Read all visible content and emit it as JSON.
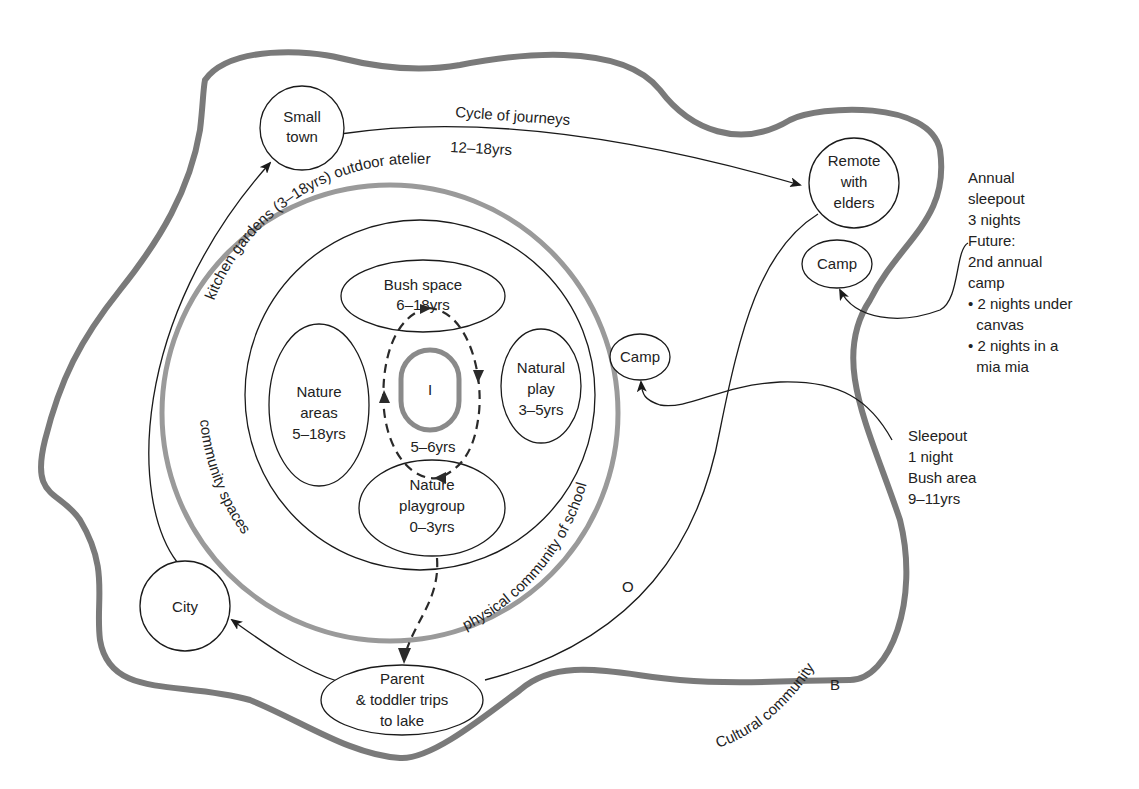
{
  "diagram": {
    "colors": {
      "outer_boundary": "#7a7a7a",
      "school_boundary": "#9a9a9a",
      "inner_self": "#8a8a8a",
      "line": "#1a1a1a"
    },
    "cycle_label": "Cycle of journeys",
    "cycle_age": "12–18yrs",
    "kitchen_label": "kitchen gardens (3–18yrs) outdoor atelier",
    "community_spaces": "community spaces",
    "physical_community": "physical community of school",
    "cultural_community": "Cultural community",
    "letter_o": "O",
    "letter_b": "B",
    "self_label": "I",
    "self_age": "5–6yrs",
    "nodes": {
      "small_town": [
        "Small",
        "town"
      ],
      "remote": [
        "Remote",
        "with",
        "elders"
      ],
      "camp_outer": "Camp",
      "camp_inner": "Camp",
      "city": "City",
      "parent": [
        "Parent",
        "& toddler trips",
        "to lake"
      ],
      "bush_space": [
        "Bush space",
        "6–18yrs"
      ],
      "nature_areas": [
        "Nature",
        "areas",
        "5–18yrs"
      ],
      "natural_play": [
        "Natural",
        "play",
        "3–5yrs"
      ],
      "playgroup": [
        "Nature",
        "playgroup",
        "0–3yrs"
      ]
    },
    "annotations": {
      "annual": [
        "Annual",
        "sleepout",
        "3 nights",
        "Future:",
        "2nd annual",
        "camp",
        "• 2 nights under",
        "  canvas",
        "• 2 nights in a",
        "  mia mia"
      ],
      "sleepout": [
        "Sleepout",
        "1 night",
        "Bush area",
        "9–11yrs"
      ]
    }
  }
}
